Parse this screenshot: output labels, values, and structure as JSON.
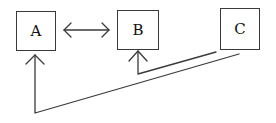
{
  "diagram": {
    "nodes": [
      {
        "id": "A",
        "label": "A"
      },
      {
        "id": "B",
        "label": "B"
      },
      {
        "id": "C",
        "label": "C"
      }
    ],
    "edges": [
      {
        "from": "A",
        "to": "B",
        "type": "bidirectional"
      },
      {
        "from": "C",
        "to": "B",
        "type": "directed"
      },
      {
        "from": "C",
        "to": "A",
        "type": "directed"
      }
    ],
    "colors": {
      "stroke": "#3a3a3a",
      "background": "#ffffff",
      "text": "#111111"
    }
  }
}
